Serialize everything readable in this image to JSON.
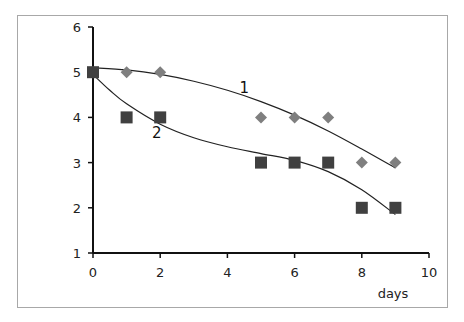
{
  "chart_data": {
    "type": "scatter",
    "title": "",
    "xlabel": "days",
    "ylabel": "",
    "xlim": [
      0,
      10
    ],
    "ylim": [
      1,
      6
    ],
    "x_ticks": [
      "0",
      "2",
      "4",
      "6",
      "8",
      "10"
    ],
    "y_ticks": [
      "1",
      "2",
      "3",
      "4",
      "5",
      "6"
    ],
    "grid": false,
    "legend": "none (curves labeled inline '1' and '2')",
    "series": [
      {
        "name": "1",
        "marker": "diamond",
        "color": "#7f7f7f",
        "x": [
          0,
          1,
          2,
          5,
          6,
          7,
          8,
          9
        ],
        "y": [
          5,
          5,
          5,
          4,
          4,
          4,
          3,
          3
        ],
        "trendline": "polynomial fit, ~5.1 at day 0 decreasing to ~2.9 at day 9"
      },
      {
        "name": "2",
        "marker": "square",
        "color": "#404040",
        "x": [
          0,
          1,
          2,
          5,
          6,
          7,
          8,
          9
        ],
        "y": [
          5,
          4,
          4,
          3,
          3,
          3,
          2,
          2
        ],
        "trendline": "polynomial fit, ~5.0 at day 0 decreasing to ~1.9 at day 9"
      }
    ],
    "annotations": [
      {
        "text": "1",
        "x": 4.5,
        "y": 4.55
      },
      {
        "text": "2",
        "x": 1.9,
        "y": 3.55
      }
    ]
  },
  "labels": {
    "xlabel": "days",
    "curve1": "1",
    "curve2": "2",
    "xticks": [
      "0",
      "2",
      "4",
      "6",
      "8",
      "10"
    ],
    "yticks": [
      "1",
      "2",
      "3",
      "4",
      "5",
      "6"
    ]
  },
  "colors": {
    "series1": "#7f7f7f",
    "series2": "#404040",
    "axis": "#111111",
    "frame": "#a8a8a8"
  }
}
